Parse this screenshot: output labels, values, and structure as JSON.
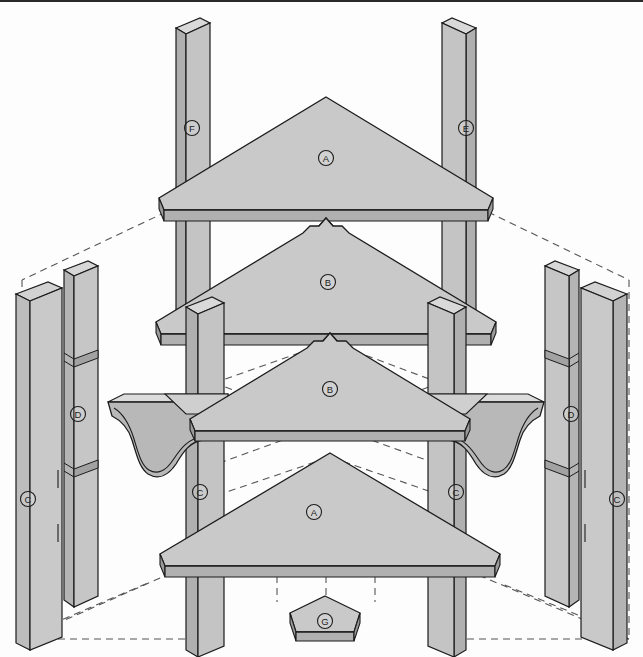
{
  "diagram": {
    "type": "exploded-isometric-assembly",
    "background_color": "#fdfdfd",
    "outline_color": "#1c1c1c",
    "face_top_color": "#c9c9c9",
    "face_light_color": "#d2d2d2",
    "face_mid_color": "#bdbdbd",
    "face_dark_color": "#a8a8a8",
    "face_shadow_color": "#9a9a9a",
    "guide_line_color": "#555555",
    "guide_line_style": "dashed"
  },
  "labels": [
    {
      "id": "A",
      "letter": "A",
      "name": "top-shelf-A",
      "x": 326,
      "y": 156
    },
    {
      "id": "B",
      "letter": "B",
      "name": "second-shelf-B",
      "x": 328,
      "y": 280
    },
    {
      "id": "B2",
      "letter": "B",
      "name": "third-shelf-B",
      "x": 330,
      "y": 387
    },
    {
      "id": "A2",
      "letter": "A",
      "name": "bottom-shelf-A",
      "x": 314,
      "y": 510
    },
    {
      "id": "F",
      "letter": "F",
      "name": "rear-left-post-F",
      "x": 192,
      "y": 126
    },
    {
      "id": "E",
      "letter": "E",
      "name": "rear-right-post-E",
      "x": 466,
      "y": 126
    },
    {
      "id": "C1",
      "letter": "C",
      "name": "outer-left-panel-C",
      "x": 28,
      "y": 497
    },
    {
      "id": "D1",
      "letter": "D",
      "name": "left-cleat-D",
      "x": 78,
      "y": 412
    },
    {
      "id": "C2",
      "letter": "C",
      "name": "front-left-post-C",
      "x": 200,
      "y": 490
    },
    {
      "id": "C3",
      "letter": "C",
      "name": "front-right-post-C",
      "x": 456,
      "y": 490
    },
    {
      "id": "D2",
      "letter": "D",
      "name": "right-cleat-D",
      "x": 571,
      "y": 412
    },
    {
      "id": "C4",
      "letter": "C",
      "name": "outer-right-panel-C",
      "x": 617,
      "y": 497
    },
    {
      "id": "G",
      "letter": "G",
      "name": "corner-foot-G",
      "x": 325,
      "y": 619
    }
  ],
  "parts": [
    {
      "key": "A",
      "name": "triangular-shelf-top",
      "count": 2,
      "description": "Plain triangular corner shelf"
    },
    {
      "key": "B",
      "name": "triangular-shelf-notched",
      "count": 2,
      "description": "Triangular corner shelf with rear notches"
    },
    {
      "key": "C",
      "name": "vertical-post-panel",
      "count": 4,
      "description": "Tall vertical post / side panel"
    },
    {
      "key": "D",
      "name": "vertical-cleat",
      "count": 2,
      "description": "Narrow vertical cleat with dadoes"
    },
    {
      "key": "E",
      "name": "rear-right-post",
      "count": 1,
      "description": "Rear right upright post"
    },
    {
      "key": "F",
      "name": "rear-left-post",
      "count": 1,
      "description": "Rear left upright post"
    },
    {
      "key": "G",
      "name": "corner-foot-plate",
      "count": 1,
      "description": "Small pentagonal corner foot plate"
    }
  ]
}
